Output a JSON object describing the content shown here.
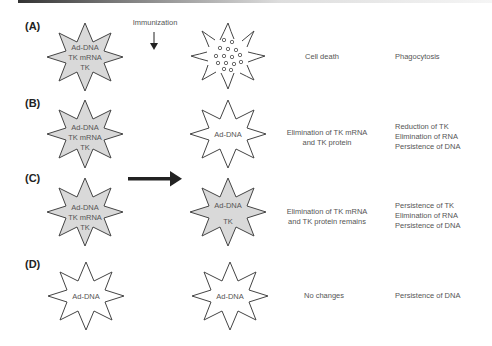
{
  "figure": {
    "header_bar": true,
    "immunization_label": "Immunization",
    "colors": {
      "cell_fill_infected": "#d9d9d9",
      "cell_fill_clean": "#ffffff",
      "outline": "#444444",
      "arrow": "#222222"
    },
    "rows": [
      {
        "id": "A",
        "label": "(A)",
        "before": {
          "lines": [
            "Ad-DNA",
            "TK mRNA",
            "TK"
          ],
          "fill": "gray"
        },
        "after": {
          "state": "cell-death-fragments",
          "lines": []
        },
        "outcome": [
          "Cell death"
        ],
        "result": [
          "Phagocytosis"
        ]
      },
      {
        "id": "B",
        "label": "(B)",
        "before": {
          "lines": [
            "Ad-DNA",
            "TK mRNA",
            "TK"
          ],
          "fill": "gray"
        },
        "after": {
          "lines": [
            "Ad-DNA"
          ],
          "fill": "white"
        },
        "outcome": [
          "Elimination of TK mRNA",
          "and TK protein"
        ],
        "result": [
          "Reduction of TK",
          "Elimination of RNA",
          "Persistence of DNA"
        ]
      },
      {
        "id": "C",
        "label": "(C)",
        "before": {
          "lines": [
            "Ad-DNA",
            "TK mRNA",
            "TK"
          ],
          "fill": "gray"
        },
        "after": {
          "lines": [
            "Ad-DNA",
            "",
            "TK"
          ],
          "fill": "gray"
        },
        "outcome": [
          "Elimination of TK mRNA",
          "and TK protein remains"
        ],
        "result": [
          "Persistence of TK",
          "Elimination of RNA",
          "Persistence of DNA"
        ]
      },
      {
        "id": "D",
        "label": "(D)",
        "before": {
          "lines": [
            "Ad-DNA"
          ],
          "fill": "white"
        },
        "after": {
          "lines": [
            "Ad-DNA"
          ],
          "fill": "white"
        },
        "outcome": [
          "No changes"
        ],
        "result": [
          "Persistence of DNA"
        ]
      }
    ]
  }
}
